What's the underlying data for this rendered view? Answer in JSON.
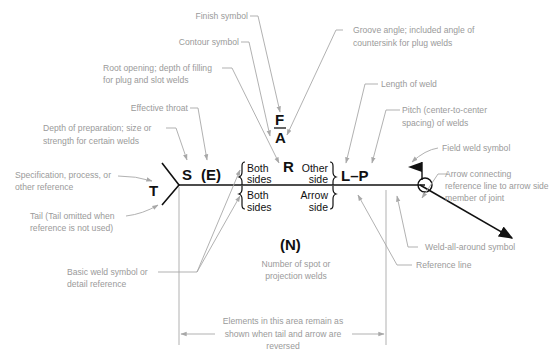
{
  "diagram": {
    "type": "standard-welding-symbol",
    "symbols": {
      "tail_letter": "T",
      "size": "S",
      "effective_throat": "(E)",
      "finish": "F",
      "angle": "A",
      "root": "R",
      "length_pitch": "L–P",
      "number": "(N)",
      "upper_left": [
        "Both",
        "sides"
      ],
      "upper_right": [
        "Other",
        "side"
      ],
      "lower_left": [
        "Both",
        "sides"
      ],
      "lower_right": [
        "Arrow",
        "side"
      ]
    },
    "labels": {
      "finish_symbol": [
        "Finish symbol"
      ],
      "contour_symbol": [
        "Contour symbol"
      ],
      "root_opening": [
        "Root opening; depth of filling",
        "for plug and slot welds"
      ],
      "effective_throat": [
        "Effective throat"
      ],
      "depth_of_preparation": [
        "Depth of preparation; size or",
        "strength for certain welds"
      ],
      "specification": [
        "Specification, process, or",
        "other reference"
      ],
      "tail": [
        "Tail (Tail omitted when",
        "reference is not used)"
      ],
      "basic_weld_symbol": [
        "Basic weld symbol or",
        "detail reference"
      ],
      "number_of_welds": [
        "Number of spot or",
        "projection welds"
      ],
      "groove_angle": [
        "Groove angle; included angle of",
        "countersink for plug welds"
      ],
      "length_of_weld": [
        "Length of weld"
      ],
      "pitch": [
        "Pitch (center-to-center",
        "spacing) of welds"
      ],
      "field_weld": [
        "Field weld symbol"
      ],
      "arrow_connecting": [
        "Arrow connecting",
        "reference line to arrow side",
        "member of joint"
      ],
      "weld_all_around": [
        "Weld-all-around symbol"
      ],
      "reference_line": [
        "Reference line"
      ],
      "elements_area": [
        "Elements in this area remain as",
        "shown when tail and arrow are",
        "reversed"
      ]
    },
    "colors": {
      "ink": "#111111",
      "label": "#9a9a9a",
      "leader": "#a8a8a8"
    }
  }
}
